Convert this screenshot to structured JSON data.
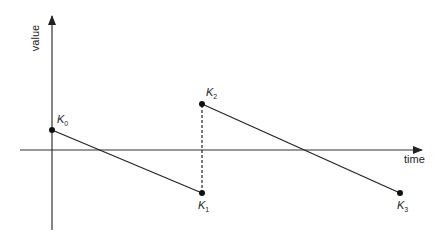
{
  "diagram": {
    "axes": {
      "x_label": "time",
      "y_label": "value"
    },
    "points": [
      {
        "name": "K",
        "sub": "0",
        "x": 52,
        "y": 130
      },
      {
        "name": "K",
        "sub": "1",
        "x": 202,
        "y": 193
      },
      {
        "name": "K",
        "sub": "2",
        "x": 202,
        "y": 104
      },
      {
        "name": "K",
        "sub": "3",
        "x": 400,
        "y": 193
      }
    ],
    "segments": [
      {
        "from": "K0",
        "to": "K1",
        "style": "solid"
      },
      {
        "from": "K1",
        "to": "K2",
        "style": "dashed"
      },
      {
        "from": "K2",
        "to": "K3",
        "style": "solid"
      }
    ],
    "colors": {
      "line": "#222222",
      "axis": "#333333"
    }
  }
}
